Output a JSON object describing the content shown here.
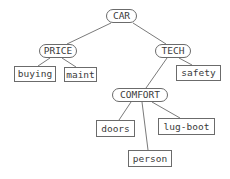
{
  "diagram": {
    "type": "tree",
    "background": "#ffffff",
    "colors": {
      "node_border": "#6b6b6b",
      "edge": "#7a7a7a",
      "text": "#3a3a3a"
    },
    "nodes": {
      "car": {
        "label": "CAR",
        "shape": "rounded"
      },
      "price": {
        "label": "PRICE",
        "shape": "rounded"
      },
      "tech": {
        "label": "TECH",
        "shape": "rounded"
      },
      "comfort": {
        "label": "COMFORT",
        "shape": "rounded"
      },
      "buying": {
        "label": "buying",
        "shape": "rect"
      },
      "maint": {
        "label": "maint",
        "shape": "rect"
      },
      "safety": {
        "label": "safety",
        "shape": "rect"
      },
      "doors": {
        "label": "doors",
        "shape": "rect"
      },
      "lug_boot": {
        "label": "lug-boot",
        "shape": "rect"
      },
      "person": {
        "label": "person",
        "shape": "rect"
      }
    },
    "edges": [
      {
        "from": "CAR",
        "to": "PRICE"
      },
      {
        "from": "CAR",
        "to": "TECH"
      },
      {
        "from": "PRICE",
        "to": "buying"
      },
      {
        "from": "PRICE",
        "to": "maint"
      },
      {
        "from": "TECH",
        "to": "safety"
      },
      {
        "from": "TECH",
        "to": "COMFORT"
      },
      {
        "from": "COMFORT",
        "to": "doors"
      },
      {
        "from": "COMFORT",
        "to": "lug-boot"
      },
      {
        "from": "COMFORT",
        "to": "person"
      }
    ]
  }
}
